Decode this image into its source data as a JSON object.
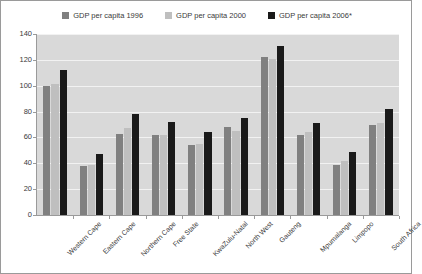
{
  "chart_data": {
    "type": "bar",
    "title": "",
    "xlabel": "",
    "ylabel": "",
    "ylim": [
      0,
      140
    ],
    "ytick_step": 20,
    "yticks": [
      0,
      20,
      40,
      60,
      80,
      100,
      120,
      140
    ],
    "grid": true,
    "legend_position": "top-center",
    "categories": [
      "Western Cape",
      "Eastern Cape",
      "Northern Cape",
      "Free State",
      "KwaZulu-Natal",
      "North West",
      "Gauteng",
      "Mpumalanga",
      "Limpopo",
      "South Africa"
    ],
    "series": [
      {
        "name": "GDP per capita 1996",
        "color": "#808080",
        "values": [
          100,
          38,
          63,
          62,
          54,
          68,
          122,
          62,
          39,
          70
        ]
      },
      {
        "name": "GDP per capita 2000",
        "color": "#bfbfbf",
        "values": [
          101,
          39,
          67,
          62,
          55,
          65,
          121,
          64,
          42,
          71
        ]
      },
      {
        "name": "GDP per capita 2006*",
        "color": "#1a1a1a",
        "values": [
          112,
          47,
          78,
          72,
          64,
          75,
          131,
          71,
          49,
          82
        ]
      }
    ]
  },
  "style": {
    "plot_background": "#d9d9d9",
    "gridline_color": "#f2f2f2",
    "axis_color": "#9a9a9a",
    "text_color": "#3a3a3a",
    "figure_border": "#9a9a9a"
  }
}
